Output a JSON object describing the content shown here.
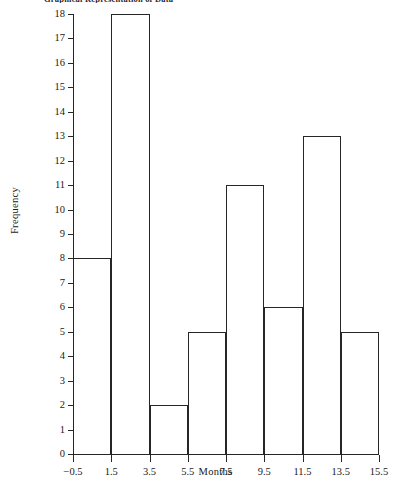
{
  "chart_data": {
    "type": "bar",
    "title": "Graphical Representation of Data",
    "xlabel": "Months",
    "ylabel": "Frequency",
    "categories": [
      "-0.5-1.5",
      "1.5-3.5",
      "3.5-5.5",
      "5.5-7.5",
      "7.5-9.5",
      "9.5-11.5",
      "11.5-13.5",
      "13.5-15.5"
    ],
    "bin_edges": [
      -0.5,
      1.5,
      3.5,
      5.5,
      7.5,
      9.5,
      11.5,
      13.5,
      15.5
    ],
    "values": [
      8,
      18,
      2,
      5,
      11,
      6,
      13,
      5
    ],
    "bin_width": 2,
    "xlim": [
      -0.5,
      15.5
    ],
    "ylim": [
      0,
      18
    ],
    "grid": false,
    "legend": false,
    "bar_style": "outline",
    "bar_edge_color": "#262626",
    "bar_fill_color": "none",
    "background_color": "#ffffff",
    "x_tick_labels": [
      "−0.5",
      "1.5",
      "3.5",
      "5.5",
      "7.5",
      "9.5",
      "11.5",
      "13.5",
      "15.5"
    ],
    "x_tick_values": [
      -0.5,
      1.5,
      3.5,
      5.5,
      7.5,
      9.5,
      11.5,
      13.5,
      15.5
    ],
    "y_tick_labels": [
      "0",
      "1",
      "2",
      "3",
      "4",
      "5",
      "6",
      "7",
      "8",
      "9",
      "10",
      "11",
      "12",
      "13",
      "14",
      "15",
      "16",
      "17",
      "18"
    ],
    "y_tick_values": [
      0,
      1,
      2,
      3,
      4,
      5,
      6,
      7,
      8,
      9,
      10,
      11,
      12,
      13,
      14,
      15,
      16,
      17,
      18
    ]
  }
}
